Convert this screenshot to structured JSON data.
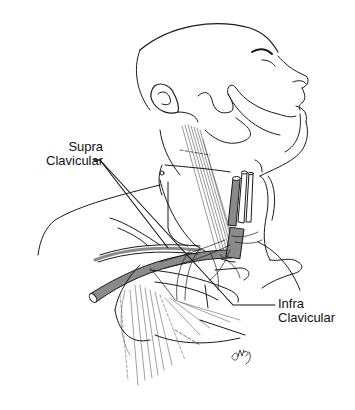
{
  "figure": {
    "labels": [
      {
        "id": "supra",
        "lines": [
          "Supra",
          "Clavicular"
        ]
      },
      {
        "id": "infra",
        "lines": [
          "Infra",
          "Clavicular"
        ]
      }
    ],
    "signature": "CMP",
    "colors": {
      "line": "#1a1a1a",
      "vessel_fill": "#8a8a8a",
      "background": "#ffffff"
    }
  }
}
